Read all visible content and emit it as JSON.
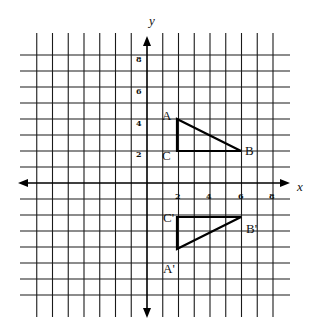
{
  "diagram": {
    "type": "coordinate-plane-reflection",
    "axes": {
      "x_label": "x",
      "y_label": "y",
      "x_ticks": [
        "2",
        "4",
        "6",
        "8"
      ],
      "y_ticks": [
        "8",
        "6",
        "4",
        "2"
      ]
    },
    "triangle_original": {
      "vertices": [
        {
          "label": "A",
          "x": 2,
          "y": 4
        },
        {
          "label": "B",
          "x": 6,
          "y": 2
        },
        {
          "label": "C",
          "x": 2,
          "y": 2
        }
      ]
    },
    "triangle_image": {
      "vertices": [
        {
          "label": "A'",
          "x": 2,
          "y": -4
        },
        {
          "label": "B'",
          "x": 6,
          "y": -2
        },
        {
          "label": "C'",
          "x": 2,
          "y": -2
        }
      ]
    },
    "colors": {
      "line": "#000000",
      "background": "#ffffff"
    }
  }
}
